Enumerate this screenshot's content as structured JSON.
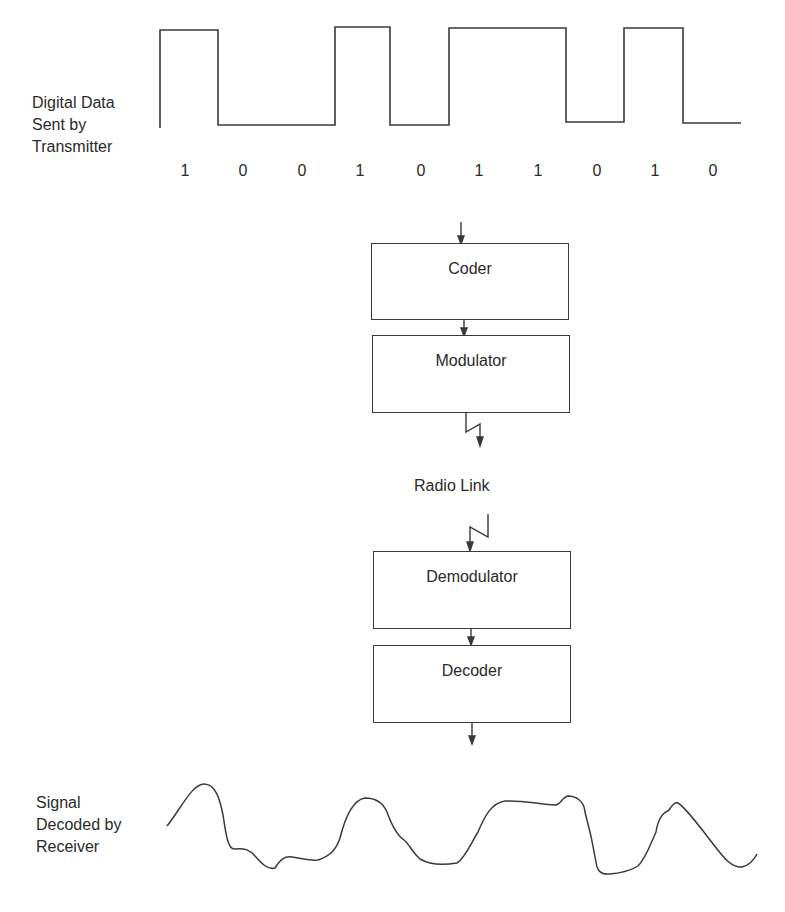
{
  "transmitter": {
    "label_lines": [
      "Digital Data",
      "Sent by",
      "Transmitter"
    ],
    "bits": [
      "1",
      "0",
      "0",
      "1",
      "0",
      "1",
      "1",
      "0",
      "1",
      "0"
    ]
  },
  "blocks": {
    "coder": "Coder",
    "modulator": "Modulator",
    "radio_link": "Radio Link",
    "demodulator": "Demodulator",
    "decoder": "Decoder"
  },
  "receiver": {
    "label_lines": [
      "Signal",
      "Decoded by",
      "Receiver"
    ]
  },
  "colors": {
    "line": "#3a3a3a",
    "text": "#2a2a2a",
    "background": "#ffffff"
  }
}
